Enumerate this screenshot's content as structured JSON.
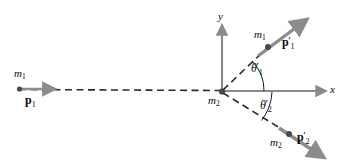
{
  "figure": {
    "kind": "two-dimensional-collision-diagram",
    "background_color": "#ffffff",
    "size": {
      "width": 351,
      "height": 164
    }
  },
  "colors": {
    "arrow_gray": "#8c8c8c",
    "axis_gray": "#8a8a8a",
    "dash_black": "#2a2a2a",
    "dot_black": "#4a4a4a",
    "text_black": "#0a0a0a",
    "arc_black": "#1a1a1a"
  },
  "axes": {
    "origin": {
      "x": 222,
      "y": 92
    },
    "y_axis": {
      "label": "y",
      "label_x": 221,
      "label_y": 12,
      "from_y": 24,
      "to_y": 92
    },
    "x_axis": {
      "label": "x",
      "label_x": 330,
      "label_y": 84,
      "from_x": 222,
      "to_x": 327
    }
  },
  "incoming": {
    "mass_label": {
      "base": "m",
      "sub": "1"
    },
    "mass_label_x": 14,
    "mass_label_y": 68,
    "momentum_label": {
      "base": "p",
      "sub": "1"
    },
    "momentum_label_x": 25,
    "momentum_label_y": 94,
    "particle_dot": {
      "x": 19,
      "y": 89
    },
    "arrow_from": {
      "x": 19,
      "y": 89
    },
    "arrow_to": {
      "x": 57,
      "y": 89
    },
    "dashed_path_from": {
      "x": 19,
      "y": 89
    },
    "dashed_path_to": {
      "x": 222,
      "y": 90
    }
  },
  "outgoing_1": {
    "mass_label": {
      "base": "m",
      "sub": "1"
    },
    "mass_label_x": 255,
    "mass_label_y": 30,
    "momentum_label": {
      "base": "p",
      "prime": "′",
      "sub": "1"
    },
    "momentum_label_x": 283,
    "momentum_label_y": 36,
    "particle_dot": {
      "x": 268,
      "y": 47
    },
    "arrow_from": {
      "x": 258,
      "y": 55
    },
    "arrow_to": {
      "x": 309,
      "y": 18
    },
    "dashed_path_from": {
      "x": 222,
      "y": 92
    },
    "dashed_path_to": {
      "x": 266,
      "y": 49
    },
    "angle_label": {
      "base": "θ",
      "prime": "′",
      "sub": "1"
    },
    "angle_label_x": 252,
    "angle_label_y": 62,
    "angle_arc_radius": 40,
    "angle_degrees": 44
  },
  "outgoing_2": {
    "mass_label": {
      "base": "m",
      "sub": "2"
    },
    "mass_label_x": 271,
    "mass_label_y": 137,
    "momentum_label": {
      "base": "p",
      "prime": "′",
      "sub": "2"
    },
    "momentum_label_x": 298,
    "momentum_label_y": 131,
    "particle_dot": {
      "x": 289,
      "y": 134
    },
    "arrow_from": {
      "x": 279,
      "y": 128
    },
    "arrow_to": {
      "x": 326,
      "y": 159
    },
    "dashed_path_from": {
      "x": 222,
      "y": 92
    },
    "dashed_path_to": {
      "x": 287,
      "y": 133
    },
    "angle_label": {
      "base": "θ",
      "prime": "′",
      "sub": "2"
    },
    "angle_label_x": 261,
    "angle_label_y": 99,
    "angle_arc_radius": 48,
    "angle_degrees": -32
  },
  "target": {
    "mass_label": {
      "base": "m",
      "sub": "2"
    },
    "mass_label_x": 209,
    "mass_label_y": 95,
    "particle_dot": {
      "x": 222,
      "y": 92
    }
  }
}
